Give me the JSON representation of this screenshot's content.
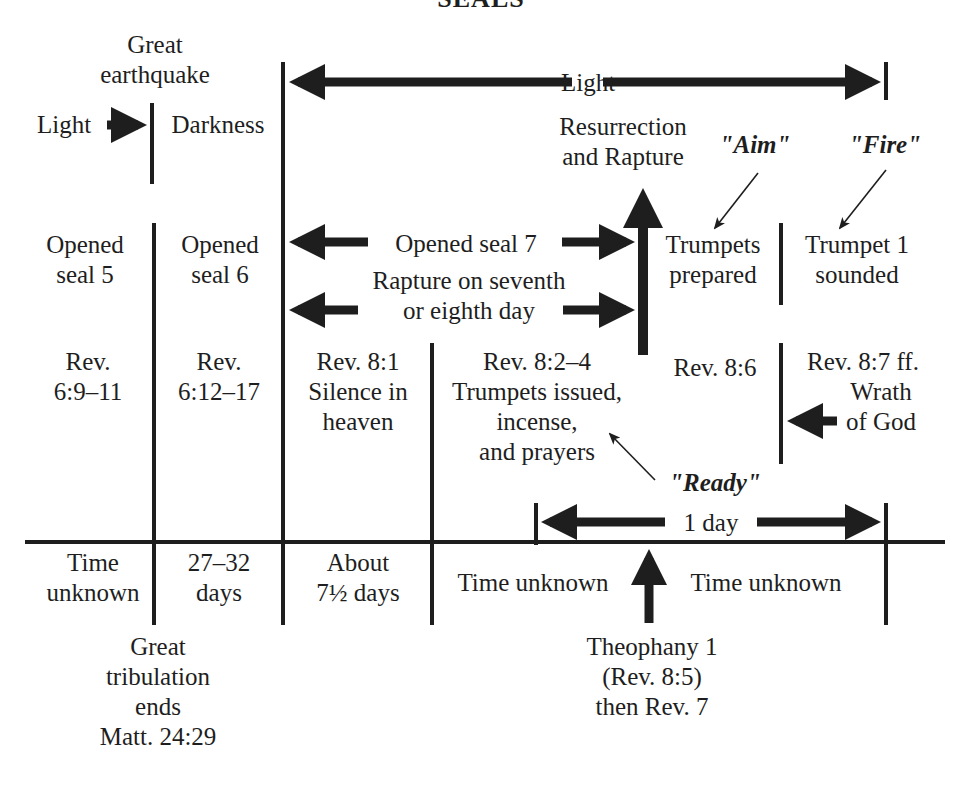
{
  "title": "SEALS",
  "colors": {
    "ink": "#1e1e1e",
    "background": "#ffffff"
  },
  "top": {
    "great_earthquake": [
      "Great",
      "earthquake"
    ],
    "light_left": "Light",
    "darkness": "Darkness",
    "light_span": "Light",
    "resurrection": [
      "Resurrection",
      "and Rapture"
    ],
    "aim": "\"Aim\"",
    "fire": "\"Fire\""
  },
  "row_events": {
    "seal5": [
      "Opened",
      "seal 5"
    ],
    "seal6": [
      "Opened",
      "seal 6"
    ],
    "seal7": "Opened seal 7",
    "rapture_day": [
      "Rapture on seventh",
      "or eighth day"
    ],
    "trumpets_prepared": [
      "Trumpets",
      "prepared"
    ],
    "trumpet1": [
      "Trumpet 1",
      "sounded"
    ]
  },
  "row_refs": {
    "rev_6_9": [
      "Rev.",
      "6:9–11"
    ],
    "rev_6_12": [
      "Rev.",
      "6:12–17"
    ],
    "rev_8_1": [
      "Rev. 8:1",
      "Silence in",
      "heaven"
    ],
    "rev_8_2": [
      "Rev. 8:2–4",
      "Trumpets issued,",
      "incense,",
      "and prayers"
    ],
    "rev_8_6": "Rev. 8:6",
    "rev_8_7": [
      "Rev. 8:7 ff.",
      "Wrath",
      "of God"
    ],
    "ready": "\"Ready\"",
    "one_day": "1 day"
  },
  "row_durations": {
    "d1": [
      "Time",
      "unknown"
    ],
    "d2": [
      "27–32",
      "days"
    ],
    "d3": [
      "About",
      "7½ days"
    ],
    "d4": "Time unknown",
    "d5": "Time unknown"
  },
  "bottom": {
    "tribulation": [
      "Great",
      "tribulation",
      "ends",
      "Matt. 24:29"
    ],
    "theophany": [
      "Theophany 1",
      "(Rev. 8:5)",
      "then Rev. 7"
    ]
  }
}
